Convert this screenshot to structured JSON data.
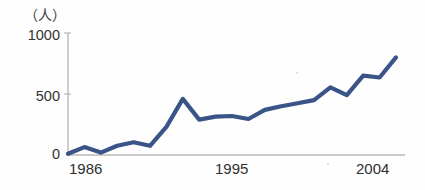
{
  "chart_data": {
    "type": "line",
    "title": "",
    "subtitle": "",
    "xlabel": "",
    "ylabel": "（人）",
    "unit_label": "（人）",
    "ylim": [
      0,
      1000
    ],
    "ytick_labels": [
      "1000",
      "500",
      "0"
    ],
    "ytick_values": [
      1000,
      500,
      0
    ],
    "xtick_labels": [
      "1986",
      "1995",
      "2004"
    ],
    "xtick_values": [
      1986,
      1995,
      2004
    ],
    "grid": false,
    "legend": false,
    "legend_position": "none",
    "series": [
      {
        "name": "人数",
        "color": "#3a5488",
        "x": [
          1985,
          1986,
          1987,
          1988,
          1989,
          1990,
          1991,
          1992,
          1993,
          1994,
          1995,
          1996,
          1997,
          1998,
          1999,
          2000,
          2001,
          2002,
          2003,
          2004,
          2005
        ],
        "values": [
          10,
          65,
          20,
          75,
          105,
          75,
          230,
          460,
          290,
          315,
          320,
          295,
          370,
          400,
          425,
          450,
          555,
          490,
          650,
          635,
          800
        ]
      }
    ],
    "colors": {
      "line": "#3a5488",
      "axis": "#b9b9b4",
      "text": "#333333",
      "background": "#fefefe"
    }
  },
  "axis": {
    "y_top_label": "1000",
    "y_mid_label": "500",
    "y_zero_label": "0",
    "x_first_label": "1986",
    "x_mid_label": "1995",
    "x_last_label": "2004",
    "unit": "（人）"
  }
}
